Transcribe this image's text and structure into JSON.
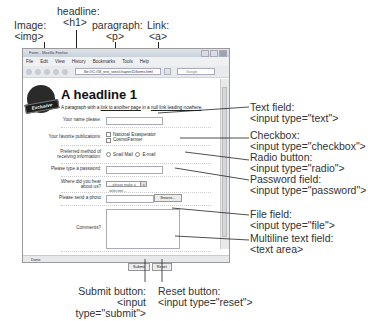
{
  "callouts": {
    "image": {
      "label": "Image:",
      "tag": "<img>"
    },
    "headline": {
      "label": "headline:",
      "tag": "<h1>"
    },
    "paragraph": {
      "label": "paragraph:",
      "tag": "<p>"
    },
    "link": {
      "label": "Link:",
      "tag": "<a>"
    },
    "text_field": {
      "label": "Text field:",
      "tag": "<input type=\"text\">"
    },
    "checkbox": {
      "label": "Checkbox:",
      "tag": "<input type=\"checkbox\">"
    },
    "radio": {
      "label": "Radio button:",
      "tag": "<input type=\"radio\">"
    },
    "password": {
      "label": "Password field:",
      "tag": "<input type=\"password\">"
    },
    "file": {
      "label": "File field:",
      "tag": "<input type=\"file\">"
    },
    "textarea": {
      "label": "Multiline text field:",
      "tag": "<text area>"
    },
    "submit": {
      "label": "Submit button:",
      "tag": "<input type=\"submit\">"
    },
    "reset": {
      "label": "Reset button:",
      "tag": "<input type=\"reset\">"
    }
  },
  "browser": {
    "title": "Form - Mozilla Firefox",
    "menu": [
      "File",
      "Edit",
      "View",
      "History",
      "Bookmarks",
      "Tools",
      "Help"
    ],
    "url": "file:///C:/58_test_sites/chapter11/forms.html",
    "search_placeholder": "Google",
    "status": "Done"
  },
  "page": {
    "logo_badge": "Exclusive",
    "headline": "A headline 1",
    "para_before": "A paragraph with a ",
    "link1": "link to another page",
    "para_mid": " in a ",
    "link2": "null link leading nowhere",
    "para_after": ".",
    "form": {
      "name_label": "Your name please:",
      "pubs_label": "Your favorite publications:",
      "pubs": [
        "National Exasperator",
        "CosmoFarmer"
      ],
      "method_label": "Preferred method of receiving information:",
      "methods": [
        "Snail Mail",
        "E-mail"
      ],
      "password_label": "Please type a password:",
      "hear_label": "Where did you hear about us?",
      "hear_selected": "-- please make a selection --",
      "photo_label": "Please send a photo",
      "browse_label": "Browse...",
      "comments_label": "Comments?",
      "submit_label": "Submit",
      "reset_label": "Reset"
    }
  }
}
